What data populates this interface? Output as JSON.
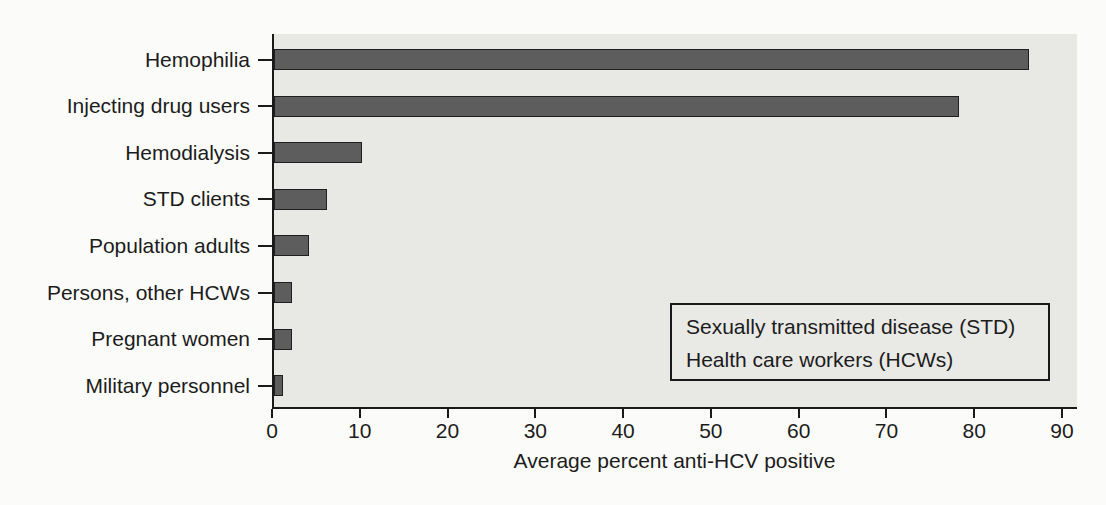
{
  "chart_data": {
    "type": "bar",
    "orientation": "horizontal",
    "title": "",
    "categories": [
      "Hemophilia",
      "Injecting drug users",
      "Hemodialysis",
      "STD clients",
      "Population adults",
      "Persons, other HCWs",
      "Pregnant women",
      "Military personnel"
    ],
    "values": [
      86,
      78,
      10,
      6,
      4,
      2,
      2,
      1
    ],
    "xlabel": "Average percent anti-HCV positive",
    "ylabel": "",
    "x_ticks": [
      0,
      10,
      20,
      30,
      40,
      50,
      60,
      70,
      80,
      90
    ],
    "xlim": [
      0,
      91.7
    ],
    "grid": false,
    "legend": {
      "position": "lower-right",
      "lines": [
        "Sexually transmitted disease (STD)",
        "Health care workers (HCWs)"
      ]
    },
    "colors": {
      "bar_fill": "#5d5d5d",
      "bar_border": "#1f1f1f",
      "plot_background": "#e8e8e5",
      "page_background": "#fbfbf9",
      "axis": "#1a1a1a",
      "text": "#1c1c1c",
      "legend_border": "#1a1a1a",
      "legend_background": "#e9e9e6"
    }
  }
}
